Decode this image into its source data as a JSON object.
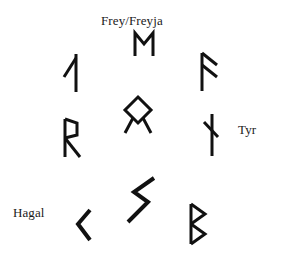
{
  "diagram": {
    "background_color": "#ffffff",
    "stroke_color": "#111111",
    "text_color": "#1a1a1a",
    "labels": [
      {
        "id": "frey",
        "text": "Frey/Freyja",
        "x": 101,
        "y": 13
      },
      {
        "id": "tyr",
        "text": "Tyr",
        "x": 238,
        "y": 122
      },
      {
        "id": "hagal",
        "text": "Hagal",
        "x": 13,
        "y": 205
      }
    ],
    "runes": [
      {
        "id": "madr",
        "name": "madr-rune",
        "label": "Frey/Freyja",
        "x": 133,
        "y": 32
      },
      {
        "id": "laguz",
        "name": "laguz-rune",
        "label": "",
        "x": 62,
        "y": 53
      },
      {
        "id": "ansuz",
        "name": "ansuz-rune",
        "label": "",
        "x": 199,
        "y": 52
      },
      {
        "id": "othala",
        "name": "othala-rune",
        "label": "",
        "x": 122,
        "y": 95
      },
      {
        "id": "raido",
        "name": "raido-rune",
        "label": "",
        "x": 62,
        "y": 118
      },
      {
        "id": "tyr",
        "name": "tyr-rune",
        "label": "Tyr",
        "x": 203,
        "y": 113
      },
      {
        "id": "sowilo-lg",
        "name": "sowilo-large-rune",
        "label": "",
        "x": 122,
        "y": 176
      },
      {
        "id": "hagal",
        "name": "hagal-rune",
        "label": "Hagal",
        "x": 74,
        "y": 208
      },
      {
        "id": "berkana",
        "name": "berkana-rune",
        "label": "",
        "x": 188,
        "y": 203
      }
    ]
  }
}
